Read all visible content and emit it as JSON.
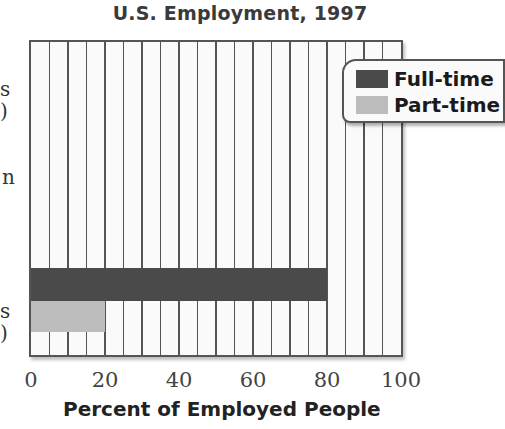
{
  "chart_data": {
    "type": "bar",
    "orientation": "horizontal",
    "title": "U.S. Employment, 1997",
    "xlabel": "Percent of Employed People",
    "ylabel": "",
    "xlim": [
      0,
      100
    ],
    "x_ticks": [
      "0",
      "20",
      "40",
      "60",
      "80",
      "100"
    ],
    "grid": {
      "vertical": true,
      "step": 5
    },
    "legend_position": "upper right",
    "categories_visible_fragments": [
      {
        "lines": [
          "s",
          ")"
        ]
      },
      {
        "lines": [
          "n"
        ]
      },
      {
        "lines": [
          "s",
          ")"
        ]
      }
    ],
    "series": [
      {
        "name": "Full-time",
        "color": "#4a4a4a",
        "values": [
          80
        ]
      },
      {
        "name": "Part-time",
        "color": "#bdbdbd",
        "values": [
          20
        ]
      }
    ]
  },
  "colors": {
    "full_time": "#4a4a4a",
    "part_time": "#bdbdbd",
    "plot_bg": "#fafafa",
    "frame": "#555555"
  }
}
